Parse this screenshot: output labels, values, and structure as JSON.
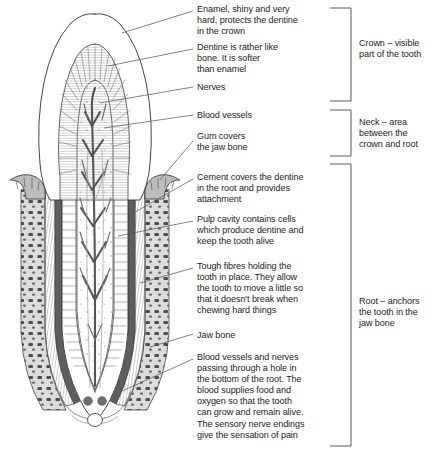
{
  "figure": {
    "callouts": [
      {
        "id": "enamel",
        "name": "enamel",
        "text": "Enamel, shiny and very\nhard, protects the dentine\nin the crown",
        "x": 197,
        "y": 4
      },
      {
        "id": "dentine",
        "name": "dentine",
        "text": "Dentine is rather like\nbone. It is softer\nthan enamel",
        "x": 197,
        "y": 42
      },
      {
        "id": "nerves",
        "name": "nerves",
        "text": "Nerves",
        "x": 197,
        "y": 82
      },
      {
        "id": "blood-vessels",
        "name": "blood-vessels",
        "text": "Blood vessels",
        "x": 197,
        "y": 110
      },
      {
        "id": "gum",
        "name": "gum",
        "text": "Gum covers\nthe jaw bone",
        "x": 197,
        "y": 131
      },
      {
        "id": "cement",
        "name": "cement",
        "text": "Cement covers the dentine\nin the root and provides\nattachment",
        "x": 197,
        "y": 172
      },
      {
        "id": "pulp-cavity",
        "name": "pulp-cavity",
        "text": "Pulp cavity contains cells\nwhich produce dentine and\nkeep the tooth alive",
        "x": 197,
        "y": 214
      },
      {
        "id": "fibres",
        "name": "periodontal-fibres",
        "text": "Tough fibres holding the\ntooth in place. They allow\nthe tooth to move a little so\nthat it doesn't break when\nchewing hard things",
        "x": 197,
        "y": 261
      },
      {
        "id": "jaw-bone",
        "name": "jaw-bone",
        "text": "Jaw bone",
        "x": 197,
        "y": 330
      },
      {
        "id": "apex",
        "name": "root-apex-vessels",
        "text": "Blood vessels and nerves\npassing through a hole in\nthe bottom of the root. The\nblood supplies food and\noxygen so that the tooth\ncan grow and remain alive.\nThe sensory nerve endings\ngive the sensation of pain",
        "x": 197,
        "y": 352
      }
    ],
    "regions": [
      {
        "id": "crown",
        "name": "crown",
        "text": "Crown – visible\npart of the tooth",
        "x": 359,
        "y": 38,
        "bracket_top": 8,
        "bracket_bottom": 101
      },
      {
        "id": "neck",
        "name": "neck",
        "text": "Neck – area\nbetween the\ncrown and root",
        "x": 359,
        "y": 117,
        "bracket_top": 110,
        "bracket_bottom": 156
      },
      {
        "id": "root",
        "name": "root",
        "text": "Root – anchors\nthe tooth in the\njaw bone",
        "x": 359,
        "y": 296,
        "bracket_top": 164,
        "bracket_bottom": 446
      }
    ],
    "colors": {
      "line": "#3c3c3c",
      "leader": "#5a5a5a",
      "text": "#1d1d1d",
      "gum_fill": "#b9b9b9",
      "cement": "#5e5e5e",
      "bone_fill": "#d6d6d6",
      "bone_speck": "#4a4a4a",
      "pulp_vessel": "#555555",
      "dentine_hatch": "#707070"
    }
  }
}
